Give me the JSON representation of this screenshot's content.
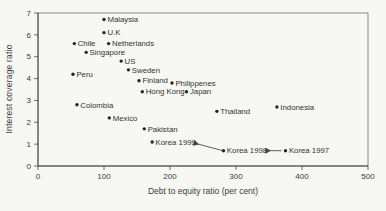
{
  "figure": {
    "background": "#f7f7f4",
    "text_color": "#3a3a3a",
    "frame_color": "#6b6b6b",
    "axis_color": "#4a4a4a"
  },
  "chart_data": {
    "type": "scatter",
    "title": "",
    "xlabel": "Debt to equity ratio (per cent)",
    "ylabel": "Interest coverage ratio",
    "xlim": [
      0,
      500
    ],
    "ylim": [
      0,
      7
    ],
    "xticks": [
      0,
      100,
      200,
      300,
      400,
      500
    ],
    "yticks": [
      0,
      1,
      2,
      3,
      4,
      5,
      6,
      7
    ],
    "grid": false,
    "legend": "none",
    "marker_color": "#262626",
    "label_color": "#333333",
    "points": [
      {
        "label": "Malaysia",
        "x": 100,
        "y": 6.7
      },
      {
        "label": "U.K",
        "x": 100,
        "y": 6.1
      },
      {
        "label": "Chile",
        "x": 55,
        "y": 5.6
      },
      {
        "label": "Netherlands",
        "x": 107,
        "y": 5.6
      },
      {
        "label": "Singapore",
        "x": 73,
        "y": 5.2
      },
      {
        "label": "US",
        "x": 126,
        "y": 4.8
      },
      {
        "label": "Sweden",
        "x": 137,
        "y": 4.4
      },
      {
        "label": "Peru",
        "x": 53,
        "y": 4.2
      },
      {
        "label": "Finland",
        "x": 153,
        "y": 3.9
      },
      {
        "label": "Philippenes",
        "x": 203,
        "y": 3.8
      },
      {
        "label": "Hong Kong",
        "x": 158,
        "y": 3.4
      },
      {
        "label": "Japan",
        "x": 225,
        "y": 3.4
      },
      {
        "label": "Colombia",
        "x": 59,
        "y": 2.8
      },
      {
        "label": "Mexico",
        "x": 108,
        "y": 2.2
      },
      {
        "label": "Thailand",
        "x": 271,
        "y": 2.5
      },
      {
        "label": "Indonesia",
        "x": 362,
        "y": 2.7
      },
      {
        "label": "Pakistan",
        "x": 161,
        "y": 1.7
      },
      {
        "label": "Korea 1999",
        "x": 173,
        "y": 1.1
      },
      {
        "label": "Korea 1998",
        "x": 281,
        "y": 0.7
      },
      {
        "label": "Korea 1997",
        "x": 375,
        "y": 0.7
      }
    ],
    "annotations": [
      {
        "name": "arrow-korea-1998-to-1999",
        "from": [
          280,
          0.7
        ],
        "to": [
          243,
          1.0
        ]
      },
      {
        "name": "arrow-korea-1997-to-1998",
        "from": [
          369,
          0.7
        ],
        "to": [
          352,
          0.7
        ]
      }
    ]
  }
}
